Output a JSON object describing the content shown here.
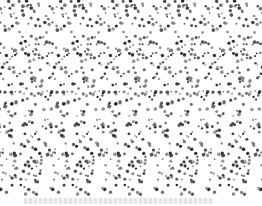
{
  "image": {
    "description": "Random-dot stereogram pattern (autostereogram) of gray dots on white, tiled horizontally",
    "tile_period_px": 52,
    "tile_count": 5,
    "dot_color": "#3a3a3a",
    "background_color": "#ffffff"
  },
  "caption": {
    "text": ""
  }
}
